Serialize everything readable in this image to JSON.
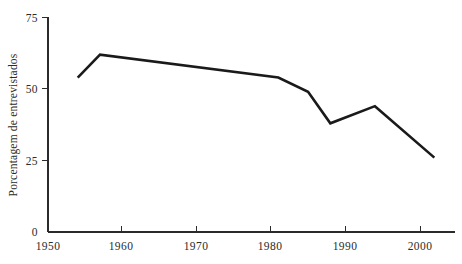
{
  "chart_data": {
    "type": "line",
    "title": "",
    "subtitle": "",
    "xlabel": "",
    "ylabel": "Porcentagem de entrevistados",
    "xlim": [
      1950,
      2005
    ],
    "ylim": [
      0,
      75
    ],
    "grid": false,
    "legend": null,
    "legend_position": "none",
    "x_ticks": [
      1950,
      1960,
      1970,
      1980,
      1990,
      2000
    ],
    "x_tick_labels": [
      "1950",
      "1960",
      "1970",
      "1980",
      "1990",
      "2000"
    ],
    "y_ticks": [
      0,
      25,
      50,
      75
    ],
    "y_tick_labels": [
      "0",
      "25",
      "50",
      "75"
    ],
    "line_color": "#1a1a1a",
    "axis_color": "#2b2b2b",
    "background_color": "#ffffff",
    "series": [
      {
        "name": "Porcentagem de entrevistados",
        "x": [
          1954,
          1957,
          1981,
          1985,
          1988,
          1994,
          2002
        ],
        "values": [
          54,
          62,
          54,
          49,
          38,
          44,
          26
        ]
      }
    ]
  },
  "figure": {
    "y_axis_title": "Porcentagem de entrevistados"
  }
}
